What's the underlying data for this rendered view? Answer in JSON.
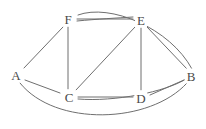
{
  "figure": {
    "name": "undirected-graph-diagram",
    "type": "graph",
    "width": 206,
    "height": 129,
    "background_color": "#ffffff",
    "edge_color": "#6f6f6f",
    "label_color": "#4a4a4a"
  },
  "vertices": [
    {
      "id": "A",
      "label": "A",
      "x": 16,
      "y": 75
    },
    {
      "id": "B",
      "label": "B",
      "x": 191,
      "y": 76
    },
    {
      "id": "C",
      "label": "C",
      "x": 69,
      "y": 97
    },
    {
      "id": "D",
      "label": "D",
      "x": 141,
      "y": 98
    },
    {
      "id": "E",
      "label": "E",
      "x": 141,
      "y": 20
    },
    {
      "id": "F",
      "label": "F",
      "x": 68,
      "y": 19
    }
  ],
  "edges": [
    {
      "from": "A",
      "to": "F",
      "shape": "straight"
    },
    {
      "from": "A",
      "to": "C",
      "shape": "straight"
    },
    {
      "from": "A",
      "to": "B",
      "shape": "curve-below"
    },
    {
      "from": "F",
      "to": "C",
      "shape": "straight"
    },
    {
      "from": "F",
      "to": "E",
      "shape": "straight"
    },
    {
      "from": "F",
      "to": "E",
      "shape": "curve-slight"
    },
    {
      "from": "F",
      "to": "B",
      "shape": "curve-above"
    },
    {
      "from": "E",
      "to": "C",
      "shape": "straight"
    },
    {
      "from": "E",
      "to": "D",
      "shape": "straight"
    },
    {
      "from": "E",
      "to": "B",
      "shape": "straight"
    },
    {
      "from": "C",
      "to": "D",
      "shape": "straight"
    },
    {
      "from": "C",
      "to": "B",
      "shape": "curve-below"
    },
    {
      "from": "D",
      "to": "B",
      "shape": "straight"
    }
  ],
  "edge_paths": {
    "a_f": "M 24 68 L 63 27",
    "a_c": "M 25 80 L 60 93",
    "a_b": "M 20 83 C 55 127, 150 124, 187 83",
    "f_c": "M 68 27 L 68 89",
    "f_e_straight": "M 77 19 L 133 19",
    "f_e_curved": "M 77 21 C 97 19, 118 18, 133 17",
    "f_b": "M 78 15 C 110 3, 170 28, 192 69",
    "e_c": "M 135 27 L 76 90",
    "e_d": "M 141 28 L 141 90",
    "e_b": "M 147 27 L 187 69",
    "c_d": "M 78 97 L 133 97",
    "c_b": "M 78 99 C 115 102, 165 92, 186 79",
    "d_b": "M 150 95 L 184 80"
  }
}
